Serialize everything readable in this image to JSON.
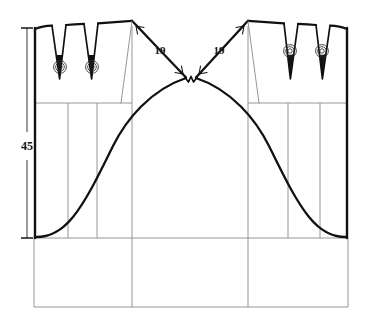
{
  "drawing": {
    "title": "Skirt pattern draft with darts and shaped hem curve",
    "type": "technical-sewing-pattern",
    "canvas": {
      "width": 377,
      "height": 321
    },
    "colors": {
      "outline": "#111111",
      "construction": "#8a8a8a",
      "dimension": "#141414",
      "background": "#ffffff"
    },
    "line_weights": {
      "outline": 2.2,
      "dart": 1.6,
      "construction": 0.9,
      "dimension": 0.8
    }
  },
  "dimensions": [
    {
      "id": "height-45",
      "label": "45",
      "orientation": "vertical",
      "label_x": 18,
      "label_y": 146,
      "line_x": 27,
      "from_y": 27,
      "to_y": 238,
      "terminator": "tick"
    },
    {
      "id": "shoulder-left-19",
      "label": "19",
      "orientation": "diagonal",
      "label_x": 157,
      "label_y": 52,
      "from_x": 131,
      "from_y": 28,
      "to_x": 185,
      "to_y": 77,
      "terminator": "arrow"
    },
    {
      "id": "shoulder-right-19",
      "label": "19",
      "orientation": "diagonal",
      "label_x": 214,
      "label_y": 52,
      "from_x": 246,
      "from_y": 28,
      "to_x": 192,
      "to_y": 77,
      "terminator": "arrow"
    }
  ],
  "construction_lines": {
    "horizontal": [
      {
        "id": "hipline",
        "x1": 34,
        "y1": 103,
        "x2": 132,
        "y2": 103
      },
      {
        "id": "hipline-right",
        "x1": 248,
        "y1": 103,
        "x2": 348,
        "y2": 103
      },
      {
        "id": "hemline",
        "x1": 34,
        "y1": 238,
        "x2": 348,
        "y2": 238
      },
      {
        "id": "bottom-edge",
        "x1": 34,
        "y1": 307,
        "x2": 348,
        "y2": 307
      }
    ],
    "vertical": [
      {
        "id": "grain-left-1",
        "x": 68,
        "y1": 103,
        "y2": 238
      },
      {
        "id": "grain-left-2",
        "x": 97,
        "y1": 103,
        "y2": 238
      },
      {
        "id": "centerline-left",
        "x": 132,
        "y1": 28,
        "y2": 307
      },
      {
        "id": "centerline-right",
        "x": 248,
        "y1": 28,
        "y2": 307
      },
      {
        "id": "grain-right-1",
        "x": 288,
        "y1": 103,
        "y2": 238
      },
      {
        "id": "grain-right-2",
        "x": 320,
        "y1": 103,
        "y2": 238
      },
      {
        "id": "side-left",
        "x": 34,
        "y1": 238,
        "y2": 307
      },
      {
        "id": "side-right",
        "x": 348,
        "y1": 238,
        "y2": 307
      }
    ]
  },
  "panels": {
    "left": {
      "id": "left-panel",
      "outline": "M34,28 L34,238 L348,238",
      "side_seam_x": 34,
      "top_y": 28,
      "waist_y": 238
    },
    "right": {
      "id": "right-panel",
      "side_seam_x": 348,
      "top_y": 28,
      "waist_y": 238
    }
  },
  "darts": [
    {
      "id": "dart-left-1",
      "top_left_x": 52,
      "top_right_x": 66,
      "top_y": 28,
      "point_x": 60,
      "point_y": 79,
      "marker_x": 60,
      "marker_y": 67
    },
    {
      "id": "dart-left-2",
      "top_left_x": 84,
      "top_right_x": 98,
      "top_y": 28,
      "point_x": 92,
      "point_y": 79,
      "marker_x": 92,
      "marker_y": 67
    },
    {
      "id": "dart-right-1",
      "top_left_x": 280,
      "top_right_x": 294,
      "top_y": 28,
      "point_x": 287,
      "point_y": 79,
      "marker_x": 287,
      "marker_y": 52
    },
    {
      "id": "dart-right-2",
      "top_left_x": 312,
      "top_right_x": 326,
      "top_y": 28,
      "point_x": 319,
      "point_y": 79,
      "marker_x": 319,
      "marker_y": 52
    }
  ],
  "dart_markers": {
    "type": "concentric-circle-marker",
    "radii": [
      6.5,
      4.5,
      2.5
    ]
  },
  "curves": {
    "left_hem": {
      "id": "left-hem-curve",
      "description": "S-curve from side seam hem rising to centre notch",
      "path": "M34,237 C50,237 62,232 76,215 C92,194 104,166 118,140 C130,116 152,88 186,78"
    },
    "right_hem": {
      "id": "right-hem-curve",
      "description": "Mirrored S-curve from centre notch down to right side seam hem",
      "path": "M348,237 C332,237 320,232 306,215 C290,194 278,166 264,140 C252,116 230,88 196,78"
    },
    "left_shoulder": {
      "id": "left-shoulder-slope",
      "path": "M132,24 L186,78"
    },
    "right_shoulder": {
      "id": "right-shoulder-slope",
      "path": "M248,24 L196,78"
    },
    "left_top": {
      "id": "left-top-edge",
      "path": "M34,30 C40,27 46,26 52,26"
    }
  },
  "notch": {
    "id": "centre-notch",
    "x": 191,
    "y": 78,
    "path": "M186,78 L189,82 L191,77 L193,82 L196,78"
  }
}
